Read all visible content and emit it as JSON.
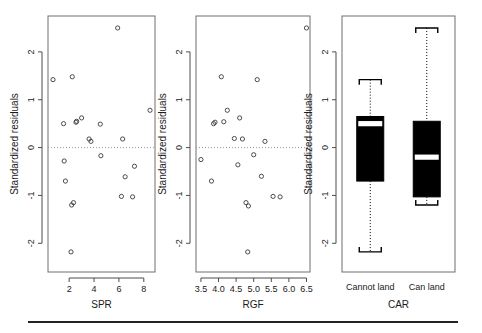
{
  "figure": {
    "ylabel": "Standardized residuals",
    "y_ticks": [
      "2",
      "1",
      "0",
      "-1",
      "-2"
    ],
    "y_tick_values": [
      2,
      1,
      0,
      -1,
      -2
    ],
    "ylim": [
      -2.6,
      2.75
    ],
    "panel_count": 3
  },
  "panels": {
    "spr": {
      "xlabel": "SPR",
      "ylabel": "Standardized residuals",
      "x_ticks": [
        "2",
        "4",
        "6",
        "8"
      ],
      "x_tick_values": [
        2,
        4,
        6,
        8
      ],
      "xlim": [
        0.3,
        8.9
      ]
    },
    "rgf": {
      "xlabel": "RGF",
      "ylabel": "Standardized residuals",
      "x_ticks": [
        "3.5",
        "4.0",
        "4.5",
        "5.0",
        "5.5",
        "6.0",
        "6.5"
      ],
      "x_tick_values": [
        3.5,
        4.0,
        4.5,
        5.0,
        5.5,
        6.0,
        6.5
      ],
      "xlim": [
        3.36,
        6.6
      ]
    },
    "car": {
      "xlabel": "CAR",
      "ylabel": "Standardized residuals",
      "categories": [
        "Cannot land",
        "Can land"
      ]
    }
  },
  "chart_data": [
    {
      "type": "scatter",
      "title": "",
      "xlabel": "SPR",
      "ylabel": "Standardized residuals",
      "xlim": [
        0.3,
        8.9
      ],
      "ylim": [
        -2.6,
        2.75
      ],
      "xticks": [
        2,
        4,
        6,
        8
      ],
      "yticks": [
        -2,
        -1,
        0,
        1,
        2
      ],
      "grid": false,
      "legend": "none",
      "annotations": [
        "dotted reference line at y = 0"
      ],
      "points": [
        {
          "x": 0.7,
          "y": 1.42
        },
        {
          "x": 2.25,
          "y": 1.48
        },
        {
          "x": 5.9,
          "y": 2.5
        },
        {
          "x": 1.55,
          "y": 0.5
        },
        {
          "x": 2.55,
          "y": 0.53
        },
        {
          "x": 2.6,
          "y": 0.55
        },
        {
          "x": 3.0,
          "y": 0.62
        },
        {
          "x": 4.5,
          "y": 0.49
        },
        {
          "x": 8.5,
          "y": 0.78
        },
        {
          "x": 3.6,
          "y": 0.18
        },
        {
          "x": 3.75,
          "y": 0.13
        },
        {
          "x": 6.3,
          "y": 0.18
        },
        {
          "x": 4.55,
          "y": -0.17
        },
        {
          "x": 1.6,
          "y": -0.28
        },
        {
          "x": 7.25,
          "y": -0.39
        },
        {
          "x": 1.7,
          "y": -0.7
        },
        {
          "x": 6.5,
          "y": -0.61
        },
        {
          "x": 2.2,
          "y": -1.2
        },
        {
          "x": 2.35,
          "y": -1.15
        },
        {
          "x": 6.2,
          "y": -1.02
        },
        {
          "x": 7.1,
          "y": -1.03
        },
        {
          "x": 2.15,
          "y": -2.18
        }
      ]
    },
    {
      "type": "scatter",
      "title": "",
      "xlabel": "RGF",
      "ylabel": "Standardized residuals",
      "xlim": [
        3.36,
        6.6
      ],
      "ylim": [
        -2.6,
        2.75
      ],
      "xticks": [
        3.5,
        4.0,
        4.5,
        5.0,
        5.5,
        6.0,
        6.5
      ],
      "yticks": [
        -2,
        -1,
        0,
        1,
        2
      ],
      "grid": false,
      "legend": "none",
      "annotations": [
        "dotted reference line at y = 0"
      ],
      "points": [
        {
          "x": 6.5,
          "y": 2.5
        },
        {
          "x": 4.08,
          "y": 1.48
        },
        {
          "x": 5.1,
          "y": 1.42
        },
        {
          "x": 4.25,
          "y": 0.78
        },
        {
          "x": 3.86,
          "y": 0.5
        },
        {
          "x": 3.9,
          "y": 0.53
        },
        {
          "x": 4.15,
          "y": 0.54
        },
        {
          "x": 4.6,
          "y": 0.62
        },
        {
          "x": 4.45,
          "y": 0.19
        },
        {
          "x": 4.68,
          "y": 0.18
        },
        {
          "x": 5.32,
          "y": 0.13
        },
        {
          "x": 5.0,
          "y": -0.15
        },
        {
          "x": 3.5,
          "y": -0.25
        },
        {
          "x": 4.55,
          "y": -0.36
        },
        {
          "x": 5.22,
          "y": -0.6
        },
        {
          "x": 3.8,
          "y": -0.7
        },
        {
          "x": 5.55,
          "y": -1.02
        },
        {
          "x": 5.75,
          "y": -1.03
        },
        {
          "x": 4.78,
          "y": -1.15
        },
        {
          "x": 4.85,
          "y": -1.22
        },
        {
          "x": 4.83,
          "y": -2.18
        }
      ]
    },
    {
      "type": "boxplot",
      "title": "",
      "xlabel": "CAR",
      "ylabel": "Standardized residuals",
      "ylim": [
        -2.6,
        2.75
      ],
      "yticks": [
        -2,
        -1,
        0,
        1,
        2
      ],
      "grid": false,
      "legend": "none",
      "categories": [
        "Cannot land",
        "Can land"
      ],
      "boxes": [
        {
          "label": "Cannot land",
          "min": -2.18,
          "q1": -0.7,
          "median": 0.5,
          "q3": 0.65,
          "max": 1.42
        },
        {
          "label": "Can land",
          "min": -1.2,
          "q1": -1.03,
          "median": -0.2,
          "q3": 0.55,
          "max": 2.5
        }
      ]
    }
  ]
}
